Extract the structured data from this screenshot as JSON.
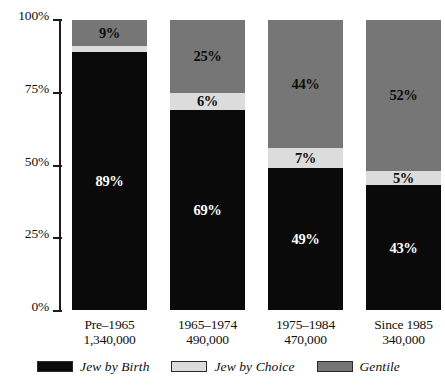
{
  "chart_data": {
    "type": "bar",
    "title": "",
    "subtitle": "",
    "xlabel": "",
    "ylabel": "",
    "stacked": true,
    "orientation": "vertical",
    "grid": false,
    "legend_position": "bottom",
    "ylim": [
      0,
      100
    ],
    "yticks": [
      "0%",
      "25%",
      "50%",
      "75%",
      "100%"
    ],
    "ytick_values": [
      0,
      25,
      50,
      75,
      100
    ],
    "categories": [
      "Pre–1965",
      "1965–1974",
      "1975–1984",
      "Since 1985"
    ],
    "category_sublabels": [
      "1,340,000",
      "490,000",
      "470,000",
      "340,000"
    ],
    "series": [
      {
        "name": "Jew by Birth",
        "color": "#0a0a0a",
        "values": [
          89,
          69,
          49,
          43
        ],
        "labels": [
          "89%",
          "69%",
          "49%",
          "43%"
        ]
      },
      {
        "name": "Jew by Choice",
        "color": "#dcdcdc",
        "values": [
          2,
          6,
          7,
          5
        ],
        "labels": [
          "",
          "6%",
          "7%",
          "5%"
        ]
      },
      {
        "name": "Gentile",
        "color": "#767676",
        "values": [
          9,
          25,
          44,
          52
        ],
        "labels": [
          "9%",
          "25%",
          "44%",
          "52%"
        ]
      }
    ],
    "legend": [
      {
        "label": "Jew by Birth",
        "color": "#0a0a0a"
      },
      {
        "label": "Jew by Choice",
        "color": "#dcdcdc"
      },
      {
        "label": "Gentile",
        "color": "#767676"
      }
    ]
  },
  "axis": {
    "ticks": [
      {
        "label": "100%",
        "value": 100
      },
      {
        "label": "75%",
        "value": 75
      },
      {
        "label": "50%",
        "value": 50
      },
      {
        "label": "25%",
        "value": 25
      },
      {
        "label": "0%",
        "value": 0
      }
    ]
  },
  "bars": [
    {
      "category": "Pre–1965",
      "count": "1,340,000",
      "segments": [
        {
          "series": "Gentile",
          "value": 9,
          "label": "9%"
        },
        {
          "series": "Jew by Choice",
          "value": 2,
          "label": ""
        },
        {
          "series": "Jew by Birth",
          "value": 89,
          "label": "89%"
        }
      ]
    },
    {
      "category": "1965–1974",
      "count": "490,000",
      "segments": [
        {
          "series": "Gentile",
          "value": 25,
          "label": "25%"
        },
        {
          "series": "Jew by Choice",
          "value": 6,
          "label": "6%"
        },
        {
          "series": "Jew by Birth",
          "value": 69,
          "label": "69%"
        }
      ]
    },
    {
      "category": "1975–1984",
      "count": "470,000",
      "segments": [
        {
          "series": "Gentile",
          "value": 44,
          "label": "44%"
        },
        {
          "series": "Jew by Choice",
          "value": 7,
          "label": "7%"
        },
        {
          "series": "Jew by Birth",
          "value": 49,
          "label": "49%"
        }
      ]
    },
    {
      "category": "Since 1985",
      "count": "340,000",
      "segments": [
        {
          "series": "Gentile",
          "value": 52,
          "label": "52%"
        },
        {
          "series": "Jew by Choice",
          "value": 5,
          "label": "5%"
        },
        {
          "series": "Jew by Birth",
          "value": 43,
          "label": "43%"
        }
      ]
    }
  ]
}
